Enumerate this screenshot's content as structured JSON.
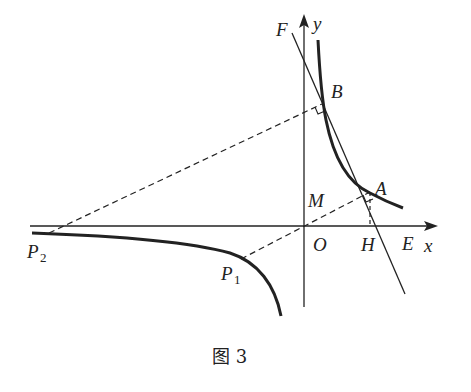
{
  "figure": {
    "caption": "图 3",
    "axes": {
      "x_label": "x",
      "y_label": "y",
      "origin_label": "O"
    },
    "points": {
      "A": "A",
      "B": "B",
      "E": "E",
      "F": "F",
      "H": "H",
      "M": "M",
      "P1": {
        "main": "P",
        "sub": "1"
      },
      "P2": {
        "main": "P",
        "sub": "2"
      }
    },
    "colors": {
      "stroke": "#222222",
      "background": "#ffffff"
    }
  }
}
